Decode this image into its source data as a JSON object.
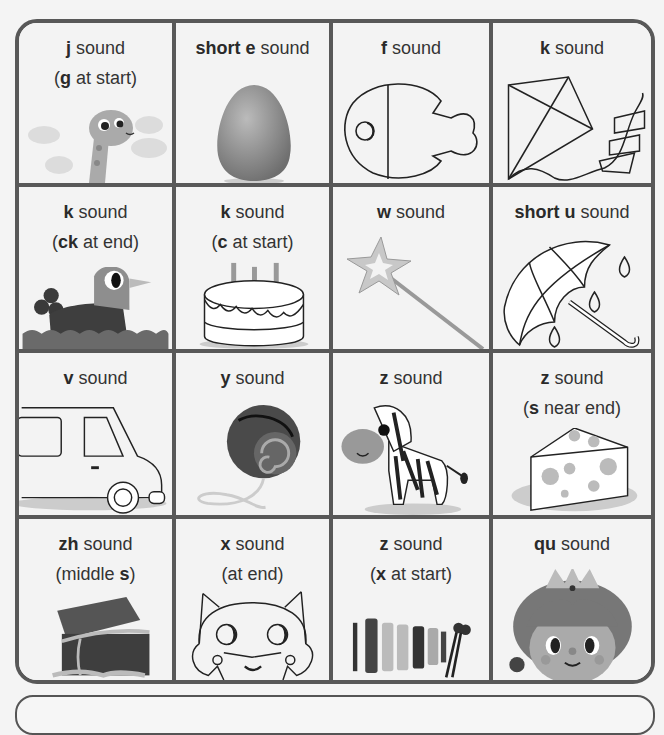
{
  "cards": [
    {
      "bold": "j",
      "rest": " sound",
      "sub_pre": "(",
      "sub_bold": "g",
      "sub_post": " at start)",
      "picture": "giraffe-icon"
    },
    {
      "bold": "short e",
      "rest": " sound",
      "picture": "egg-icon"
    },
    {
      "bold": "f",
      "rest": " sound",
      "picture": "fish-icon"
    },
    {
      "bold": "k",
      "rest": " sound",
      "picture": "kite-icon"
    },
    {
      "bold": "k",
      "rest": " sound",
      "sub_pre": "(",
      "sub_bold": "ck",
      "sub_post": " at end)",
      "picture": "duck-icon"
    },
    {
      "bold": "k",
      "rest": " sound",
      "sub_pre": "(",
      "sub_bold": "c",
      "sub_post": " at start)",
      "picture": "cake-icon"
    },
    {
      "bold": "w",
      "rest": " sound",
      "picture": "wand-icon"
    },
    {
      "bold": "short u",
      "rest": " sound",
      "picture": "umbrella-icon"
    },
    {
      "bold": "v",
      "rest": " sound",
      "picture": "van-icon"
    },
    {
      "bold": "y",
      "rest": " sound",
      "picture": "yoyo-icon"
    },
    {
      "bold": "z",
      "rest": " sound",
      "picture": "zebra-icon"
    },
    {
      "bold": "z",
      "rest": " sound",
      "sub_pre": "(",
      "sub_bold": "s",
      "sub_post": " near end)",
      "picture": "cheese-icon"
    },
    {
      "bold": "zh",
      "rest": " sound",
      "sub_pre": "(middle ",
      "sub_bold": "s",
      "sub_post": ")",
      "picture": "treasure-chest-icon"
    },
    {
      "bold": "x",
      "rest": " sound",
      "sub_pre": "(at end)",
      "sub_bold": "",
      "sub_post": "",
      "picture": "fox-icon"
    },
    {
      "bold": "z",
      "rest": " sound",
      "sub_pre": "(",
      "sub_bold": "x",
      "sub_post": " at start)",
      "picture": "xylophone-icon"
    },
    {
      "bold": "qu",
      "rest": " sound",
      "picture": "queen-icon"
    }
  ],
  "colors": {
    "border": "#585858",
    "background": "#f3f3f3",
    "text": "#333333"
  }
}
